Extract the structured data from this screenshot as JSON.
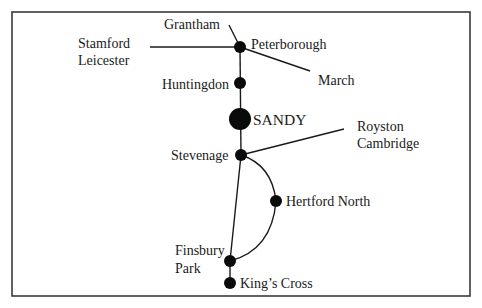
{
  "diagram": {
    "type": "railway-line-schematic",
    "colors": {
      "line": "#1a1a1a",
      "node": "#0a0a0a",
      "frame": "#3a3a3a",
      "background": "#ffffff"
    },
    "stations": [
      {
        "id": "peterborough",
        "name": "Peterborough",
        "x": 240,
        "y": 47,
        "r": 6
      },
      {
        "id": "huntingdon",
        "name": "Huntingdon",
        "x": 240,
        "y": 83,
        "r": 6
      },
      {
        "id": "sandy",
        "name": "SANDY",
        "x": 240,
        "y": 119,
        "r": 11,
        "highlighted": true
      },
      {
        "id": "stevenage",
        "name": "Stevenage",
        "x": 241,
        "y": 155,
        "r": 6
      },
      {
        "id": "hertford-north",
        "name": "Hertford North",
        "x": 276,
        "y": 201,
        "r": 6
      },
      {
        "id": "finsbury-park",
        "name_line1": "Finsbury",
        "name_line2": "Park",
        "x": 230,
        "y": 261,
        "r": 6
      },
      {
        "id": "kings-cross",
        "name": "King’s Cross",
        "x": 230,
        "y": 283,
        "r": 6
      }
    ],
    "branch_destinations": {
      "grantham": "Grantham",
      "stamford": "Stamford",
      "leicester": "Leicester",
      "march": "March",
      "royston": "Royston",
      "cambridge": "Cambridge"
    },
    "connections": [
      [
        "grantham",
        "peterborough"
      ],
      [
        "stamford-leicester",
        "peterborough"
      ],
      [
        "peterborough",
        "march"
      ],
      [
        "peterborough",
        "huntingdon"
      ],
      [
        "huntingdon",
        "sandy"
      ],
      [
        "sandy",
        "stevenage"
      ],
      [
        "stevenage",
        "royston-cambridge"
      ],
      [
        "stevenage",
        "finsbury-park"
      ],
      [
        "stevenage",
        "hertford-north"
      ],
      [
        "hertford-north",
        "finsbury-park"
      ],
      [
        "finsbury-park",
        "kings-cross"
      ]
    ]
  }
}
